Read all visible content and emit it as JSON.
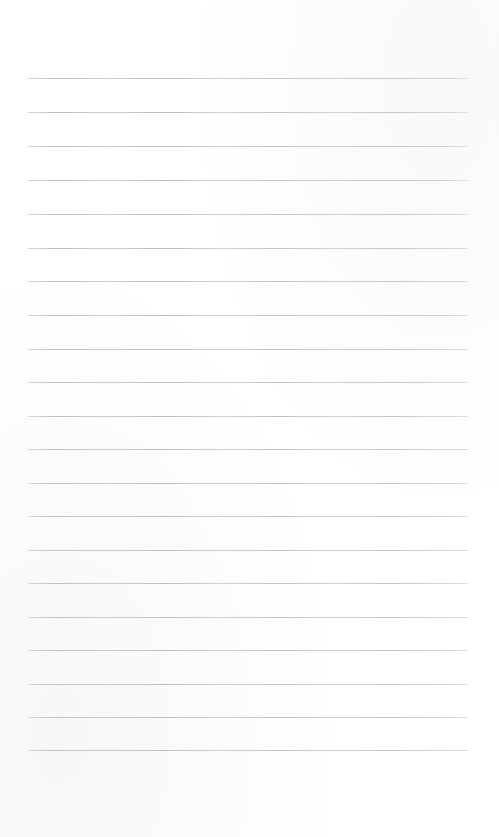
{
  "page": {
    "kind": "lined-paper-sheet",
    "title": "",
    "width_px": 499,
    "height_px": 837,
    "background_color": "#ffffff",
    "has_text_content": false,
    "has_margin_rule": false,
    "has_header": false,
    "has_footer": false,
    "top_blank_height_px": 78,
    "bottom_blank_height_px": 86
  },
  "ruling": {
    "line_color": "#c6c6ca",
    "line_thickness_px": 1,
    "line_count": 21,
    "first_line_y_px": 78,
    "last_line_y_px": 750,
    "line_spacing_px": 33.6,
    "line_left_x_px": 28,
    "line_right_x_px": 468,
    "line_width_px": 440
  },
  "lines": [
    {
      "index": 1,
      "y": 78,
      "text": ""
    },
    {
      "index": 2,
      "y": 112,
      "text": ""
    },
    {
      "index": 3,
      "y": 146,
      "text": ""
    },
    {
      "index": 4,
      "y": 180,
      "text": ""
    },
    {
      "index": 5,
      "y": 214,
      "text": ""
    },
    {
      "index": 6,
      "y": 248,
      "text": ""
    },
    {
      "index": 7,
      "y": 281,
      "text": ""
    },
    {
      "index": 8,
      "y": 315,
      "text": ""
    },
    {
      "index": 9,
      "y": 349,
      "text": ""
    },
    {
      "index": 10,
      "y": 382,
      "text": ""
    },
    {
      "index": 11,
      "y": 416,
      "text": ""
    },
    {
      "index": 12,
      "y": 449,
      "text": ""
    },
    {
      "index": 13,
      "y": 483,
      "text": ""
    },
    {
      "index": 14,
      "y": 516,
      "text": ""
    },
    {
      "index": 15,
      "y": 550,
      "text": ""
    },
    {
      "index": 16,
      "y": 583,
      "text": ""
    },
    {
      "index": 17,
      "y": 617,
      "text": ""
    },
    {
      "index": 18,
      "y": 650,
      "text": ""
    },
    {
      "index": 19,
      "y": 684,
      "text": ""
    },
    {
      "index": 20,
      "y": 717,
      "text": ""
    },
    {
      "index": 21,
      "y": 750,
      "text": ""
    }
  ]
}
